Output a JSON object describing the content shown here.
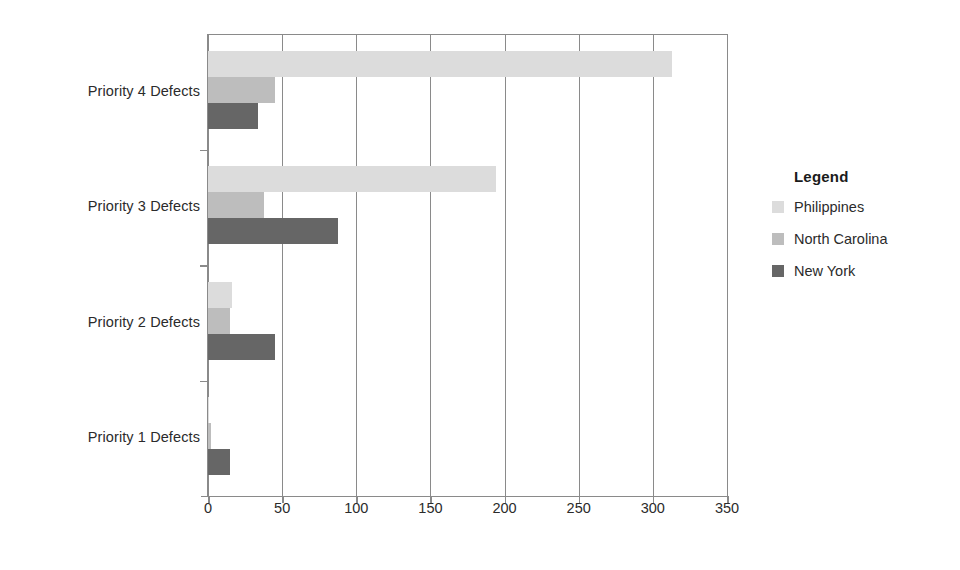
{
  "chart_data": {
    "type": "bar",
    "orientation": "horizontal",
    "title": "",
    "xlabel": "",
    "ylabel": "",
    "categories": [
      "Priority 1 Defects",
      "Priority 2 Defects",
      "Priority 3 Defects",
      "Priority 4 Defects"
    ],
    "series": [
      {
        "name": "Philippines",
        "color": "#dcdcdc",
        "values": [
          1,
          16,
          194,
          313
        ]
      },
      {
        "name": "North Carolina",
        "color": "#bdbdbd",
        "values": [
          2,
          15,
          38,
          45
        ]
      },
      {
        "name": "New York",
        "color": "#666666",
        "values": [
          15,
          45,
          88,
          34
        ]
      }
    ],
    "xlim": [
      0,
      350
    ],
    "xticks": [
      0,
      50,
      100,
      150,
      200,
      250,
      300,
      350
    ],
    "xtick_labels": [
      "0",
      "50",
      "100",
      "150",
      "200",
      "250",
      "300",
      "350"
    ],
    "grid": true,
    "grid_axis": "x",
    "legend_position": "right",
    "legend_title": "Legend"
  },
  "legend": {
    "title": "Legend",
    "items": [
      {
        "label": "Philippines",
        "color": "#dcdcdc"
      },
      {
        "label": "North Carolina",
        "color": "#bdbdbd"
      },
      {
        "label": "New York",
        "color": "#666666"
      }
    ]
  },
  "axis": {
    "category_labels": [
      "Priority 4 Defects",
      "Priority 3 Defects",
      "Priority 2 Defects",
      "Priority 1 Defects"
    ],
    "x_tick_labels": [
      "0",
      "50",
      "100",
      "150",
      "200",
      "250",
      "300",
      "350"
    ]
  }
}
